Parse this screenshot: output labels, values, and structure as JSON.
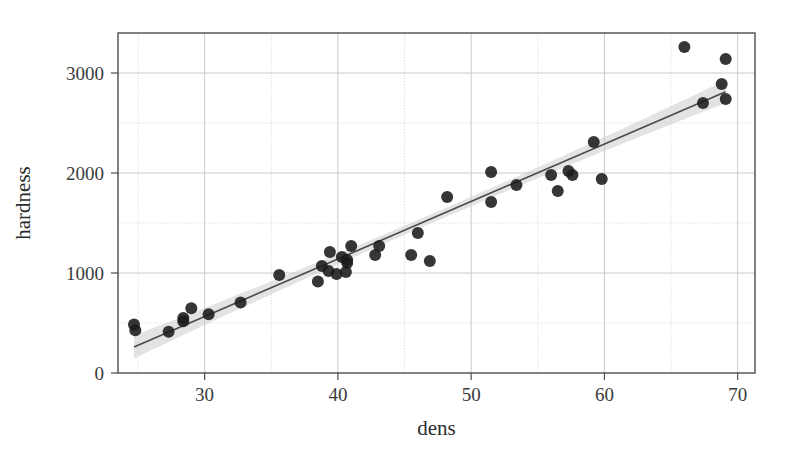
{
  "chart_data": {
    "type": "scatter",
    "title": "",
    "xlabel": "dens",
    "ylabel": "hardness",
    "xlim": [
      23.5,
      71.3
    ],
    "ylim": [
      0,
      3400
    ],
    "grid": true,
    "legend": null,
    "x_major_ticks": [
      30,
      40,
      50,
      60,
      70
    ],
    "x_major_tick_labels": [
      "30",
      "40",
      "50",
      "60",
      "70"
    ],
    "x_minor_ticks": [
      25,
      35,
      45,
      55,
      65
    ],
    "y_major_ticks": [
      0,
      1000,
      2000,
      3000
    ],
    "y_major_tick_labels": [
      "0",
      "1000",
      "2000",
      "3000"
    ],
    "y_minor_ticks": [
      500,
      1500,
      2500
    ],
    "point_color": "#1a1a1a",
    "point_opacity": 0.88,
    "point_radius": 6,
    "line_color": "#4a4a4a",
    "band_color": "#cccccc",
    "band_opacity": 0.55,
    "frame_color": "#4d4d4d",
    "grid_color": "#d4d4d4",
    "fit": {
      "type": "linear",
      "intercept": -1160,
      "slope": 57.5,
      "band_halfwidth_center": 45,
      "band_halfwidth_edge": 115
    },
    "points": [
      {
        "x": 24.7,
        "y": 484
      },
      {
        "x": 24.8,
        "y": 427
      },
      {
        "x": 27.3,
        "y": 413
      },
      {
        "x": 28.4,
        "y": 517
      },
      {
        "x": 28.4,
        "y": 549
      },
      {
        "x": 29.0,
        "y": 648
      },
      {
        "x": 30.3,
        "y": 587
      },
      {
        "x": 32.7,
        "y": 704
      },
      {
        "x": 35.6,
        "y": 979
      },
      {
        "x": 38.5,
        "y": 914
      },
      {
        "x": 38.8,
        "y": 1070
      },
      {
        "x": 39.3,
        "y": 1020
      },
      {
        "x": 39.4,
        "y": 1210
      },
      {
        "x": 39.9,
        "y": 989
      },
      {
        "x": 40.3,
        "y": 1160
      },
      {
        "x": 40.6,
        "y": 1010
      },
      {
        "x": 40.7,
        "y": 1100
      },
      {
        "x": 40.7,
        "y": 1130
      },
      {
        "x": 41.0,
        "y": 1270
      },
      {
        "x": 42.8,
        "y": 1180
      },
      {
        "x": 43.1,
        "y": 1270
      },
      {
        "x": 45.5,
        "y": 1180
      },
      {
        "x": 46.0,
        "y": 1400
      },
      {
        "x": 46.9,
        "y": 1120
      },
      {
        "x": 48.2,
        "y": 1760
      },
      {
        "x": 51.5,
        "y": 1710
      },
      {
        "x": 51.5,
        "y": 2010
      },
      {
        "x": 53.4,
        "y": 1880
      },
      {
        "x": 56.0,
        "y": 1980
      },
      {
        "x": 56.5,
        "y": 1820
      },
      {
        "x": 57.3,
        "y": 2020
      },
      {
        "x": 57.6,
        "y": 1980
      },
      {
        "x": 59.2,
        "y": 2310
      },
      {
        "x": 59.8,
        "y": 1940
      },
      {
        "x": 66.0,
        "y": 3260
      },
      {
        "x": 67.4,
        "y": 2700
      },
      {
        "x": 68.8,
        "y": 2890
      },
      {
        "x": 69.1,
        "y": 2740
      },
      {
        "x": 69.1,
        "y": 3140
      }
    ]
  },
  "axes": {
    "x_title": "dens",
    "y_title": "hardness"
  }
}
